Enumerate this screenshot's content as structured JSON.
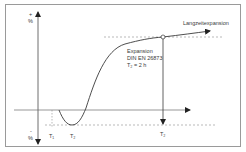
{
  "diagram": {
    "y_axis": {
      "plus_sign": "+",
      "plus_unit": "%",
      "minus_sign": "-",
      "minus_unit": "%"
    },
    "labels": {
      "long_term": "Langzeitexpansion",
      "expansion_line1": "Expansion",
      "expansion_line2": "DIN EN 26873",
      "expansion_line3": "T₂ = 2 h",
      "t1": "T₁",
      "t2_bottom": "T₂",
      "t2_right": "T₂"
    },
    "colors": {
      "line": "#4a4a4a",
      "dashed": "#8a8a8a",
      "frame": "#9a9a9a",
      "text": "#3a3a3a"
    }
  }
}
